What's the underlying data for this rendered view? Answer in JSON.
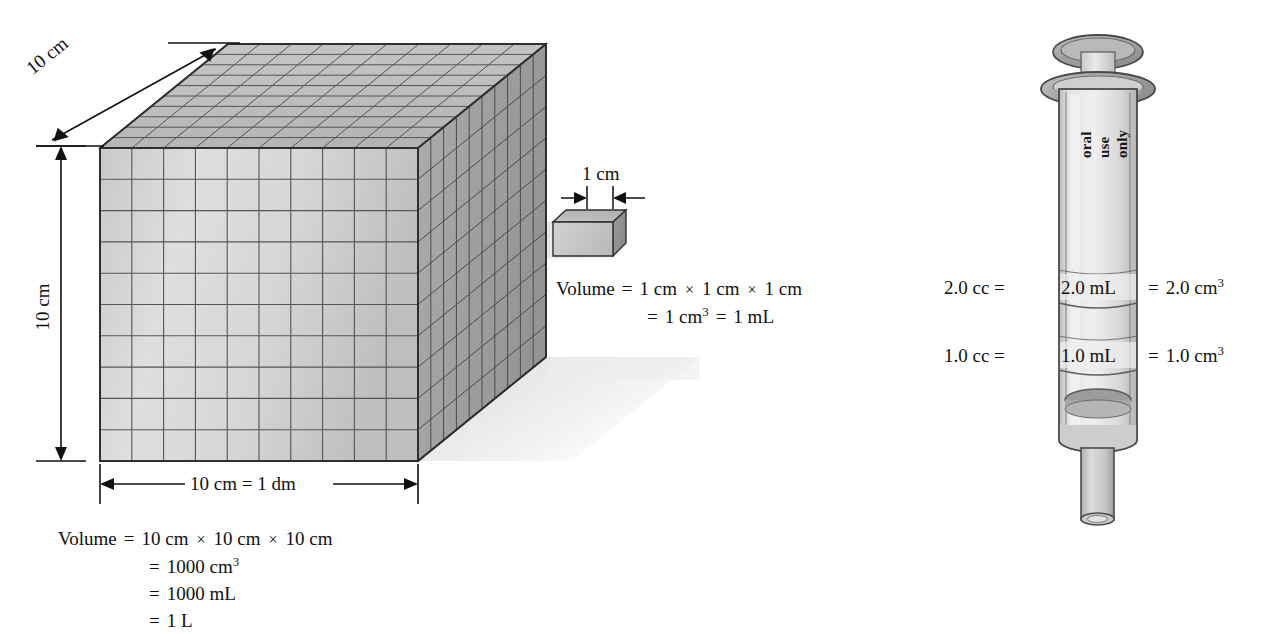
{
  "big_cube": {
    "dim_top_label": "10 cm",
    "dim_left_label": "10 cm",
    "dim_bottom_label": "10 cm  =  1 dm",
    "grid_divisions": 10,
    "face_front_color": "#d9d9d9",
    "face_top_color": "#bdbdbd",
    "face_right_color": "#a2a2a2",
    "edge_color": "#3a3a3a"
  },
  "small_cube": {
    "dim_label": "1 cm",
    "face_front_color": "#c9c9c9",
    "face_top_color": "#bdbdbd",
    "face_right_color": "#8f8f8f",
    "edge_color": "#2f2f2f"
  },
  "cube_volume": {
    "label": "Volume",
    "eq": "=",
    "line1": {
      "t1": "10 cm",
      "x1": "×",
      "t2": "10 cm",
      "x2": "×",
      "t3": "10 cm"
    },
    "line2_value": "1000 cm",
    "line2_exp": "3",
    "line3_value": "1000 mL",
    "line4_value": "1 L"
  },
  "small_cube_volume": {
    "label": "Volume",
    "eq": "=",
    "line1": {
      "t1": "1 cm",
      "x1": "×",
      "t2": "1 cm",
      "x2": "×",
      "t3": "1 cm"
    },
    "line2_value": "1 cm",
    "line2_exp": "3",
    "line2_eq2": "=",
    "line2_value2": "1 mL"
  },
  "syringe": {
    "barrel_text_line1": "oral",
    "barrel_text_line2": "use",
    "barrel_text_line3": "only",
    "mark_2": {
      "left": "2.0 cc  =",
      "inner": "2.0 mL",
      "right_eq": "=",
      "right_value": "2.0 cm",
      "right_exp": "3"
    },
    "mark_1": {
      "left": "1.0 cc  =",
      "inner": "1.0 mL",
      "right_eq": "=",
      "right_value": "1.0 cm",
      "right_exp": "3"
    },
    "body_color": "#dcdcdc",
    "rim_color": "#a9a9a9",
    "plunger_color": "#9a9a9a",
    "outline_color": "#4a4a4a"
  }
}
